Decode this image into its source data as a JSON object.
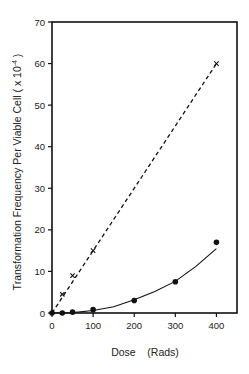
{
  "chart_data": {
    "type": "line",
    "title": "",
    "xlabel": "Dose    (Rads)",
    "ylabel": "Transformation Frequency Per Viable Cell  ( x 10⁻⁴ )",
    "xlim": [
      0,
      450
    ],
    "ylim": [
      0,
      70
    ],
    "x_ticks": [
      0,
      100,
      200,
      300,
      400
    ],
    "y_ticks": [
      0,
      10,
      20,
      30,
      40,
      50,
      60,
      70
    ],
    "grid": false,
    "legend": null,
    "series": [
      {
        "name": "x-markers (dashed linear fit)",
        "marker": "x",
        "line": "dashed",
        "points": [
          [
            25,
            4.5
          ],
          [
            50,
            9
          ],
          [
            100,
            15
          ],
          [
            400,
            60
          ]
        ],
        "fit_line": [
          [
            0,
            0
          ],
          [
            400,
            60
          ]
        ]
      },
      {
        "name": "filled circles (solid curve)",
        "marker": "circle",
        "line": "solid",
        "points": [
          [
            0,
            0
          ],
          [
            25,
            0
          ],
          [
            50,
            0.2
          ],
          [
            100,
            0.8
          ],
          [
            200,
            3
          ],
          [
            300,
            7.5
          ],
          [
            400,
            17
          ]
        ],
        "fit_curve": [
          [
            0,
            0
          ],
          [
            50,
            0.1
          ],
          [
            100,
            0.6
          ],
          [
            150,
            1.5
          ],
          [
            200,
            3.2
          ],
          [
            250,
            5.2
          ],
          [
            300,
            7.6
          ],
          [
            350,
            11.2
          ],
          [
            400,
            15.5
          ]
        ]
      }
    ]
  },
  "labels": {
    "x_tick_0": "0",
    "x_tick_100": "100",
    "x_tick_200": "200",
    "x_tick_300": "300",
    "x_tick_400": "400",
    "y_tick_0": "0",
    "y_tick_10": "10",
    "y_tick_20": "20",
    "y_tick_30": "30",
    "y_tick_40": "40",
    "y_tick_50": "50",
    "y_tick_60": "60",
    "y_tick_70": "70",
    "xlabel": "Dose    (Rads)",
    "ylabel_main": "Transformation Frequency Per Viable Cell  ( x 10",
    "ylabel_exp": "-4",
    "ylabel_close": " )"
  },
  "colors": {
    "ink": "#111111",
    "background": "#ffffff"
  }
}
